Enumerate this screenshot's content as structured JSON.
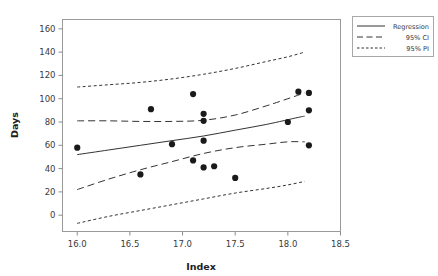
{
  "chart_data": {
    "type": "scatter",
    "title": "",
    "xlabel": "Index",
    "ylabel": "Days",
    "xlim": [
      15.86,
      18.5
    ],
    "ylim": [
      -14,
      168
    ],
    "grid": false,
    "legend_position": "outside top-right",
    "x_ticks": [
      "16.0",
      "16.5",
      "17.0",
      "17.5",
      "18.0",
      "18.5"
    ],
    "x_tick_values": [
      16.0,
      16.5,
      17.0,
      17.5,
      18.0,
      18.5
    ],
    "y_ticks": [
      "0",
      "20",
      "40",
      "60",
      "80",
      "100",
      "120",
      "140",
      "160"
    ],
    "y_tick_values": [
      0,
      20,
      40,
      60,
      80,
      100,
      120,
      140,
      160
    ],
    "points": [
      {
        "x": 16.0,
        "y": 58
      },
      {
        "x": 16.6,
        "y": 35
      },
      {
        "x": 16.7,
        "y": 91
      },
      {
        "x": 16.9,
        "y": 61
      },
      {
        "x": 17.1,
        "y": 104
      },
      {
        "x": 17.1,
        "y": 47
      },
      {
        "x": 17.2,
        "y": 87
      },
      {
        "x": 17.2,
        "y": 81
      },
      {
        "x": 17.2,
        "y": 64
      },
      {
        "x": 17.2,
        "y": 41
      },
      {
        "x": 17.3,
        "y": 42
      },
      {
        "x": 17.5,
        "y": 32
      },
      {
        "x": 18.0,
        "y": 80
      },
      {
        "x": 18.1,
        "y": 106
      },
      {
        "x": 18.2,
        "y": 105
      },
      {
        "x": 18.2,
        "y": 90
      },
      {
        "x": 18.2,
        "y": 60
      }
    ],
    "series": [
      {
        "name": "Regression",
        "style": "solid",
        "x": [
          16.0,
          16.3,
          16.6,
          16.9,
          17.2,
          17.5,
          17.8,
          18.1,
          18.16
        ],
        "values": [
          52,
          56,
          60,
          64,
          68,
          73,
          78,
          84,
          85
        ]
      },
      {
        "name": "95% CI upper",
        "style": "dashed",
        "x": [
          16.0,
          16.3,
          16.6,
          16.9,
          17.2,
          17.5,
          17.8,
          18.0,
          18.16
        ],
        "values": [
          81,
          81,
          80.5,
          80.5,
          81.5,
          86,
          94,
          100,
          105
        ]
      },
      {
        "name": "95% CI lower",
        "style": "dashed",
        "x": [
          16.0,
          16.3,
          16.6,
          16.9,
          17.2,
          17.5,
          17.8,
          18.0,
          18.16
        ],
        "values": [
          22,
          31,
          39,
          46,
          53,
          58,
          61,
          63,
          63
        ]
      },
      {
        "name": "95% PI upper",
        "style": "dotted",
        "x": [
          16.0,
          16.3,
          16.6,
          16.9,
          17.2,
          17.5,
          17.8,
          18.0,
          18.16
        ],
        "values": [
          110,
          112,
          114,
          117,
          121,
          126,
          132,
          136,
          140
        ]
      },
      {
        "name": "95% PI lower",
        "style": "dotted",
        "x": [
          16.0,
          16.3,
          16.6,
          16.9,
          17.2,
          17.5,
          17.8,
          18.0,
          18.16
        ],
        "values": [
          -7,
          -1,
          4,
          9,
          14,
          19,
          23,
          26,
          29
        ]
      }
    ],
    "legend": [
      {
        "label": "Regression",
        "style": "solid"
      },
      {
        "label": "95% CI",
        "style": "dashed"
      },
      {
        "label": "95% PI",
        "style": "dotted"
      }
    ]
  }
}
